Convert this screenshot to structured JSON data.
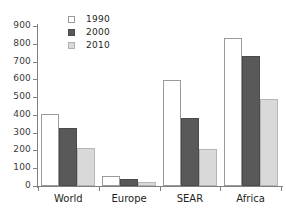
{
  "chart_data": {
    "type": "bar",
    "title": "",
    "subtitle": "",
    "xlabel": "",
    "ylabel": "",
    "categories": [
      "World",
      "Europe",
      "SEAR",
      "Africa"
    ],
    "series": [
      {
        "name": "1990",
        "color": "#ffffff",
        "values": [
          405,
          55,
          595,
          830
        ]
      },
      {
        "name": "2000",
        "color": "#595959",
        "values": [
          325,
          38,
          385,
          730
        ]
      },
      {
        "name": "2010",
        "color": "#d9d9d9",
        "values": [
          212,
          22,
          210,
          490
        ]
      }
    ],
    "ylim": [
      0,
      900
    ],
    "ytick_labels": [
      "0",
      "100",
      "200",
      "300",
      "400",
      "500",
      "600",
      "700",
      "800",
      "900"
    ],
    "ytick_values": [
      0,
      100,
      200,
      300,
      400,
      500,
      600,
      700,
      800,
      900
    ],
    "grid": false,
    "legend_position": "top-left"
  },
  "axis": {
    "tick_color": "#808080",
    "label_color": "#231f20"
  }
}
